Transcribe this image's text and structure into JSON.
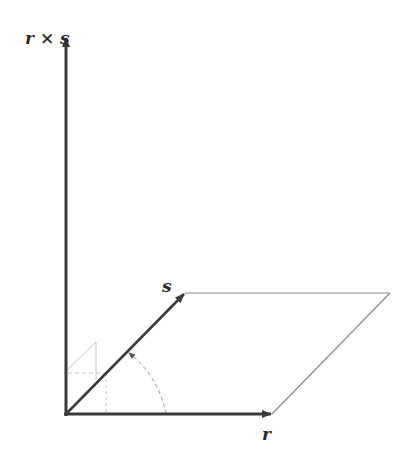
{
  "diagram": {
    "title": "",
    "labels": {
      "cross_product": "r × s",
      "vector_s": "s",
      "vector_r": "r"
    },
    "colors": {
      "vector": "#3a3a3a",
      "parallelogram": "#8a8a8a",
      "construction": "#bdbdbd",
      "background": "#ffffff"
    },
    "elements": [
      {
        "id": "r-cross-s",
        "type": "vector",
        "from": [
          66,
          414
        ],
        "to": [
          66,
          36
        ],
        "label": "r × s"
      },
      {
        "id": "s",
        "type": "vector",
        "from": [
          66,
          414
        ],
        "to": [
          185,
          293
        ],
        "label": "s"
      },
      {
        "id": "r",
        "type": "vector",
        "from": [
          66,
          414
        ],
        "to": [
          272,
          414
        ],
        "label": "r"
      },
      {
        "id": "parallelogram",
        "type": "polygon",
        "points": [
          [
            185,
            293
          ],
          [
            390,
            293
          ],
          [
            272,
            414
          ]
        ]
      },
      {
        "id": "angle-arc",
        "type": "dashed-arc",
        "from_vector": "r",
        "to_vector": "s"
      },
      {
        "id": "right-hand-mark",
        "type": "construction-lines"
      }
    ]
  }
}
